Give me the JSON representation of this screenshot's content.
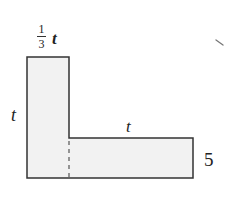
{
  "diagram": {
    "type": "l-shaped-region",
    "fill_color": "#f2f2f2",
    "stroke_color": "#333333",
    "shape": {
      "outline_points": [
        [
          27,
          57
        ],
        [
          69,
          57
        ],
        [
          69,
          138
        ],
        [
          193,
          138
        ],
        [
          193,
          178
        ],
        [
          27,
          178
        ]
      ],
      "divider_dashed": {
        "x": 69,
        "y1": 140,
        "y2": 178
      }
    },
    "labels": {
      "top_width_fraction_numerator": "1",
      "top_width_fraction_denominator": "3",
      "top_width_variable": "t",
      "left_height": "t",
      "right_width": "t",
      "right_height": "5"
    }
  }
}
